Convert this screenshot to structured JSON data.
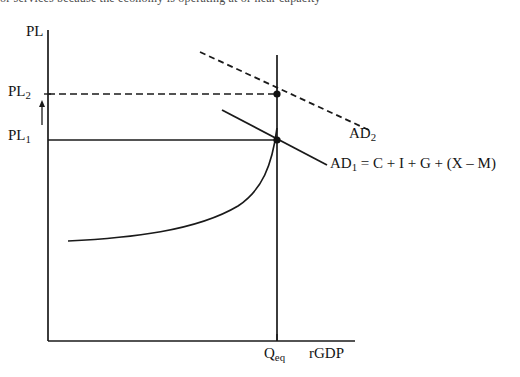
{
  "diagram": {
    "type": "economics-ad-as-graph",
    "title_fragment_cut_off_at_top": "or services because the economy is operating at or near capacity",
    "axes": {
      "y_axis_label": "PL",
      "x_axis_label": "rGDP",
      "y_axis_tick_labels": [
        "PL2",
        "PL1"
      ],
      "x_axis_tick_labels": [
        "Qeq"
      ],
      "origin_px": [
        48,
        341
      ],
      "y_axis_top_px": [
        48,
        30
      ],
      "x_axis_right_px": [
        355,
        341
      ]
    },
    "price_levels": {
      "pl1": {
        "label": "PL",
        "subscript": "1",
        "y_px": 140
      },
      "pl2": {
        "label": "PL",
        "subscript": "2",
        "y_px": 94
      }
    },
    "quantity": {
      "qeq": {
        "label": "Q",
        "subscript": "eq",
        "x_px": 277
      }
    },
    "arrow_annotation": {
      "name": "price-level-increase-arrow",
      "direction": "up",
      "from_px": [
        42,
        124
      ],
      "to_px": [
        42,
        102
      ]
    },
    "curves": [
      {
        "name": "aggregate-demand-1",
        "label": "AD",
        "subscript": "1",
        "label_full": "AD1 = C + I + G + (X – M)",
        "style": "solid",
        "from_px": [
          222,
          110
        ],
        "to_px": [
          327,
          165
        ]
      },
      {
        "name": "aggregate-demand-2",
        "label": "AD",
        "subscript": "2",
        "label_full": "AD2",
        "style": "dashed",
        "from_px": [
          200,
          52
        ],
        "to_px": [
          371,
          131
        ]
      },
      {
        "name": "short-run-aggregate-supply",
        "style": "solid-curve",
        "description": "flat then steeply rising near full capacity",
        "start_px": [
          68,
          241
        ],
        "end_px": [
          278,
          128
        ]
      }
    ],
    "guide_lines": [
      {
        "name": "pl2-dashed-guide",
        "style": "dashed",
        "from_px": [
          48,
          94
        ],
        "to_px": [
          277,
          94
        ]
      },
      {
        "name": "pl1-solid-guide",
        "style": "solid",
        "from_px": [
          48,
          140
        ],
        "to_px": [
          277,
          140
        ]
      },
      {
        "name": "qeq-vertical-guide",
        "style": "solid",
        "from_px": [
          277,
          55
        ],
        "to_px": [
          277,
          341
        ]
      }
    ],
    "equilibrium_points": [
      {
        "name": "equilibrium-point-ad2",
        "px": [
          277,
          94
        ]
      },
      {
        "name": "equilibrium-point-ad1",
        "px": [
          277,
          140
        ]
      }
    ],
    "labels": {
      "pl_axis": "PL",
      "pl2_main": "PL",
      "pl2_sub": "2",
      "pl1_main": "PL",
      "pl1_sub": "1",
      "ad2_main": "AD",
      "ad2_sub": "2",
      "ad1_main": "AD",
      "ad1_sub": "1",
      "ad1_equation": " = C + I + G + (X – M)",
      "qeq_main": "Q",
      "qeq_sub": "eq",
      "rgdp": "rGDP"
    },
    "colors": {
      "line": "#1a1a1a",
      "background": "#ffffff",
      "text": "#141414"
    }
  }
}
